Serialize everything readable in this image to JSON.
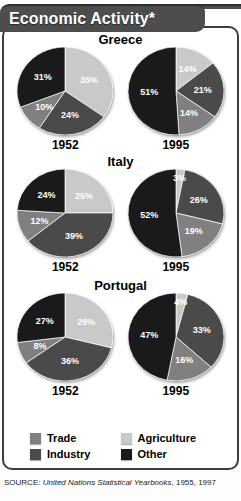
{
  "header": {
    "title": "Economic Activity*"
  },
  "legend": {
    "items": [
      {
        "label": "Trade",
        "color": "#808080",
        "key": "trade"
      },
      {
        "label": "Agriculture",
        "color": "#c9c9c9",
        "key": "agriculture"
      },
      {
        "label": "Industry",
        "color": "#4a4a4a",
        "key": "industry"
      },
      {
        "label": "Other",
        "color": "#1a1a1a",
        "key": "other"
      }
    ]
  },
  "source": {
    "prefix": "SOURCE: ",
    "publication": "United Nations Statistical Yearbooks",
    "suffix": ", 1955, 1997"
  },
  "countries": [
    {
      "name": "Greece",
      "years": [
        "1952",
        "1995"
      ]
    },
    {
      "name": "Italy",
      "years": [
        "1952",
        "1995"
      ]
    },
    {
      "name": "Portugal",
      "years": [
        "1952",
        "1995"
      ]
    }
  ],
  "chart_data": {
    "type": "pie",
    "title": "Economic Activity*",
    "categories": [
      "Agriculture",
      "Industry",
      "Trade",
      "Other"
    ],
    "category_colors": [
      "#c9c9c9",
      "#4a4a4a",
      "#808080",
      "#1a1a1a"
    ],
    "unit": "%",
    "charts": [
      {
        "country": "Greece",
        "year": "1952",
        "labels": [
          "35%",
          "24%",
          "10%",
          "31%"
        ],
        "values": [
          35,
          24,
          10,
          31
        ]
      },
      {
        "country": "Greece",
        "year": "1995",
        "labels": [
          "14%",
          "21%",
          "14%",
          "51%"
        ],
        "values": [
          14,
          21,
          14,
          51
        ]
      },
      {
        "country": "Italy",
        "year": "1952",
        "labels": [
          "25%",
          "39%",
          "12%",
          "24%"
        ],
        "values": [
          25,
          39,
          12,
          24
        ]
      },
      {
        "country": "Italy",
        "year": "1995",
        "labels": [
          "3%",
          "26%",
          "19%",
          "52%"
        ],
        "values": [
          3,
          26,
          19,
          52
        ]
      },
      {
        "country": "Portugal",
        "year": "1952",
        "labels": [
          "29%",
          "36%",
          "8%",
          "27%"
        ],
        "values": [
          29,
          36,
          8,
          27
        ]
      },
      {
        "country": "Portugal",
        "year": "1995",
        "labels": [
          "4%",
          "33%",
          "16%",
          "47%"
        ],
        "values": [
          4,
          33,
          16,
          47
        ]
      }
    ],
    "source": "SOURCE: United Nations Statistical Yearbooks, 1955, 1997"
  }
}
